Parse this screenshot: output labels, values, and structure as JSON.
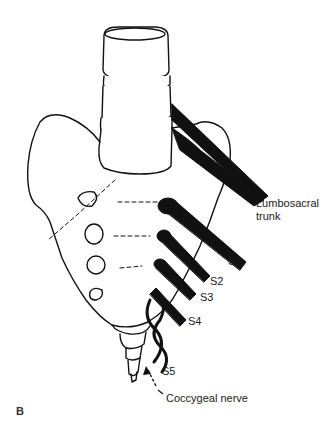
{
  "figure": {
    "panel_label": "B",
    "labels": {
      "lumbosacral_line1": "Lumbosacral",
      "lumbosacral_line2": "trunk",
      "s1": "S1",
      "s2": "S2",
      "s3": "S3",
      "s4": "S4",
      "s5": "S5",
      "coccygeal": "Coccygeal nerve"
    },
    "colors": {
      "line": "#111111",
      "background": "#ffffff"
    }
  }
}
